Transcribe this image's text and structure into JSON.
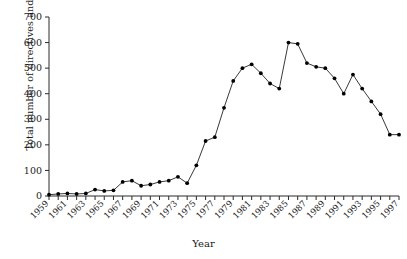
{
  "chart_data": {
    "type": "line",
    "title": "",
    "xlabel": "Year",
    "ylabel": "Total number of directives and regulations",
    "xlim": [
      1959,
      1997
    ],
    "ylim": [
      0,
      700
    ],
    "ytick_step": 100,
    "yticks": [
      0,
      100,
      200,
      300,
      400,
      500,
      600,
      700
    ],
    "xticks": [
      1959,
      1961,
      1963,
      1965,
      1967,
      1969,
      1971,
      1973,
      1975,
      1977,
      1979,
      1981,
      1983,
      1985,
      1987,
      1989,
      1991,
      1993,
      1995,
      1997
    ],
    "xtick_labels": [
      "1959",
      "1961",
      "1963",
      "1965",
      "1967",
      "1969",
      "1971",
      "1973",
      "1975",
      "1977",
      "1979",
      "1981",
      "1983",
      "1985",
      "1987",
      "1989",
      "1991",
      "1993",
      "1995",
      "1997"
    ],
    "grid": false,
    "legend": false,
    "marker": "filled-circle",
    "line_color": "#222222",
    "marker_color": "#000000",
    "x": [
      1959,
      1960,
      1961,
      1962,
      1963,
      1964,
      1965,
      1966,
      1967,
      1968,
      1969,
      1970,
      1971,
      1972,
      1973,
      1974,
      1975,
      1976,
      1977,
      1978,
      1979,
      1980,
      1981,
      1982,
      1983,
      1984,
      1985,
      1986,
      1987,
      1988,
      1989,
      1990,
      1991,
      1992,
      1993,
      1994,
      1995,
      1996,
      1997
    ],
    "values": [
      5,
      8,
      10,
      8,
      10,
      25,
      20,
      22,
      55,
      60,
      40,
      45,
      55,
      60,
      75,
      50,
      120,
      215,
      230,
      345,
      450,
      500,
      515,
      480,
      440,
      420,
      600,
      595,
      520,
      505,
      500,
      460,
      400,
      475,
      420,
      370,
      320,
      240,
      240
    ]
  }
}
